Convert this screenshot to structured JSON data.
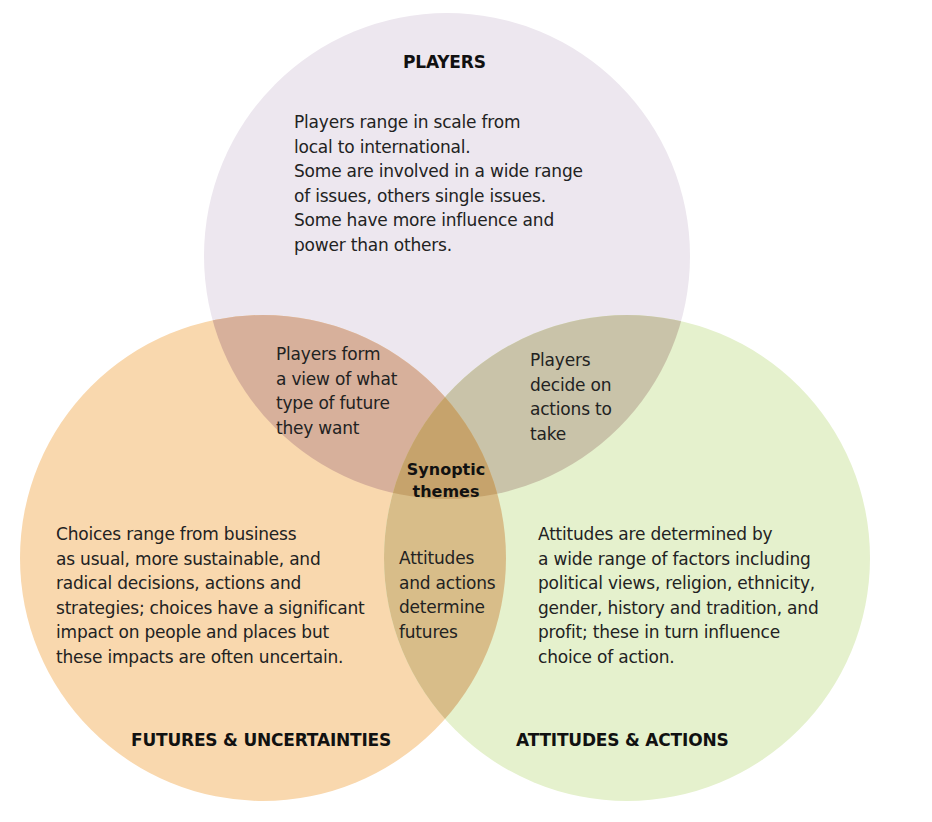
{
  "diagram": {
    "type": "venn",
    "colors": {
      "players": "#ede7ef",
      "futures": "#f9d8ae",
      "attitudes": "#e5f1cd",
      "players_futures": "#d7b09b",
      "players_attitudes": "#c9c3a9",
      "futures_attitudes": "#d8bd89",
      "center": "#c6a36c"
    },
    "circles": [
      {
        "id": "players",
        "title": "PLAYERS",
        "lines": [
          "Players range in scale from",
          "local to international.",
          "Some are involved in a wide range",
          "of issues, others single issues.",
          "Some have more influence and",
          "power than others."
        ]
      },
      {
        "id": "futures",
        "title": "FUTURES & UNCERTAINTIES",
        "lines": [
          "Choices range from business",
          "as usual, more sustainable, and",
          "radical decisions, actions and",
          "strategies; choices have a significant",
          "impact on people and places but",
          "these impacts are often uncertain."
        ]
      },
      {
        "id": "attitudes",
        "title": "ATTITUDES & ACTIONS",
        "lines": [
          "Attitudes are determined by",
          "a wide range of factors including",
          "political views, religion, ethnicity,",
          "gender, history and tradition, and",
          "profit; these in turn influence",
          "choice of action."
        ]
      }
    ],
    "overlaps": {
      "players_futures": [
        "Players form",
        "a view of what",
        "type of future",
        "they want"
      ],
      "players_attitudes": [
        "Players",
        "decide on",
        "actions to",
        "take"
      ],
      "futures_attitudes": [
        "Attitudes",
        "and actions",
        "determine",
        "futures"
      ],
      "center": [
        "Synoptic",
        "themes"
      ]
    }
  }
}
